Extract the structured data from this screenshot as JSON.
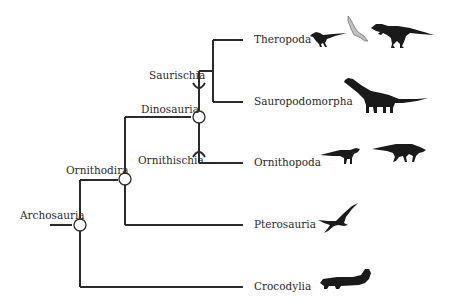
{
  "diagram": {
    "type": "phylogenetic-tree",
    "line_color": "#2b2b2b",
    "root": "Archosauria",
    "nodes": [
      {
        "label": "Archosauria",
        "kind": "node-circle"
      },
      {
        "label": "Ornithodira",
        "kind": "node-circle"
      },
      {
        "label": "Dinosauria",
        "kind": "node-circle"
      },
      {
        "label": "Saurischia",
        "kind": "stem-arc"
      },
      {
        "label": "Ornithischia",
        "kind": "stem-arc"
      }
    ],
    "taxa": [
      {
        "label": "Theropoda",
        "silhouettes": [
          "small-theropod",
          "bird",
          "tyrannosaur"
        ]
      },
      {
        "label": "Sauropodomorpha",
        "silhouettes": [
          "sauropod"
        ]
      },
      {
        "label": "Ornithopoda",
        "silhouettes": [
          "small-ornithopod",
          "hadrosaur"
        ]
      },
      {
        "label": "Pterosauria",
        "silhouettes": [
          "pterosaur"
        ]
      },
      {
        "label": "Crocodylia",
        "silhouettes": [
          "crocodile"
        ]
      }
    ],
    "edges": [
      [
        "Archosauria",
        "Ornithodira"
      ],
      [
        "Archosauria",
        "Crocodylia"
      ],
      [
        "Ornithodira",
        "Dinosauria"
      ],
      [
        "Ornithodira",
        "Pterosauria"
      ],
      [
        "Dinosauria",
        "Saurischia"
      ],
      [
        "Dinosauria",
        "Ornithischia"
      ],
      [
        "Saurischia",
        "Theropoda"
      ],
      [
        "Saurischia",
        "Sauropodomorpha"
      ],
      [
        "Ornithischia",
        "Ornithopoda"
      ]
    ]
  }
}
